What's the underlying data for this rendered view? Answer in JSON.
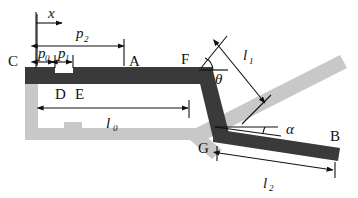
{
  "figure": {
    "colors": {
      "dark_link": "#3a3a3a",
      "light_link": "#c8c8c8",
      "line": "#111111",
      "background": "#ffffff"
    }
  },
  "axis": {
    "name": "x-axis",
    "label": "x",
    "direction": "right"
  },
  "points": {
    "C": "C",
    "A": "A",
    "D": "D",
    "E": "E",
    "F": "F",
    "G": "G",
    "B": "B"
  },
  "dimensions": [
    {
      "name": "p0",
      "base": "p",
      "sub": "0"
    },
    {
      "name": "p1",
      "base": "p",
      "sub": "1"
    },
    {
      "name": "p2",
      "base": "p",
      "sub": "2"
    },
    {
      "name": "l0",
      "base": "l",
      "sub": "0"
    },
    {
      "name": "l1",
      "base": "l",
      "sub": "1"
    },
    {
      "name": "l2",
      "base": "l",
      "sub": "2"
    }
  ],
  "angles": [
    {
      "name": "theta",
      "symbol": "θ",
      "at": "F"
    },
    {
      "name": "alpha",
      "symbol": "α",
      "at": "G"
    }
  ]
}
